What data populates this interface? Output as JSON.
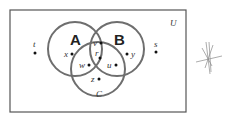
{
  "diagram": {
    "type": "venn",
    "universe_label": "U",
    "sets": [
      {
        "name": "A",
        "label": "A"
      },
      {
        "name": "B",
        "label": "B"
      },
      {
        "name": "C",
        "label": "C"
      }
    ],
    "elements": [
      {
        "label": "t",
        "region": "outside"
      },
      {
        "label": "s",
        "region": "outside"
      },
      {
        "label": "x",
        "region": "A only"
      },
      {
        "label": "y",
        "region": "B only"
      },
      {
        "label": "z",
        "region": "C only"
      },
      {
        "label": "v",
        "region": "A∩B only"
      },
      {
        "label": "w",
        "region": "A∩C only"
      },
      {
        "label": "u",
        "region": "B∩C only"
      },
      {
        "label": "r",
        "region": "A∩B∩C"
      }
    ],
    "colors": {
      "circle": "#6e6e6e",
      "border": "#555555"
    }
  }
}
